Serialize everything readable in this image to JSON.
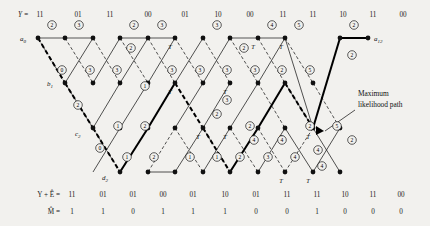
{
  "figure": {
    "background_color": "#f2f1ee",
    "ink_color": "#1a1a1a",
    "ml_path_color": "#000000"
  },
  "chart_data": {
    "type": "diagram",
    "subtype": "viterbi-trellis",
    "n_stages": 12,
    "n_states": 4,
    "state_labels": [
      "a",
      "b",
      "c",
      "d"
    ],
    "state_row_y": [
      38,
      83,
      128,
      172
    ],
    "column_x": [
      38,
      65,
      93,
      120,
      148,
      175,
      203,
      230,
      258,
      285,
      313,
      340,
      368
    ],
    "node_labels": [
      {
        "text": "a",
        "sub": "0",
        "x": 26,
        "y": 40
      },
      {
        "text": "b",
        "sub": "1",
        "x": 53,
        "y": 85
      },
      {
        "text": "c",
        "sub": "2",
        "x": 81,
        "y": 134
      },
      {
        "text": "d",
        "sub": "2",
        "x": 108,
        "y": 178
      },
      {
        "text": "a",
        "sub": "12",
        "x": 374,
        "y": 40
      }
    ],
    "received_label": "Y =",
    "received_sequence": [
      "11",
      "01",
      "11",
      "00",
      "01",
      "10",
      "00",
      "11",
      "11",
      "10",
      "11",
      "00"
    ],
    "corrected_label": "Y + Ê =",
    "corrected_sequence": [
      "11",
      "01",
      "01",
      "00",
      "01",
      "10",
      "01",
      "11",
      "11",
      "10",
      "11",
      "00"
    ],
    "message_label": "M̂ =",
    "message_bits": [
      "1",
      "1",
      "0",
      "1",
      "1",
      "1",
      "0",
      "0",
      "1",
      "0",
      "0",
      "0"
    ],
    "annotation": {
      "line1": "Maximum",
      "line2": "likelihood path"
    },
    "survivor_mark": "T",
    "path_metrics": [
      {
        "value": "2",
        "x": 52,
        "y": 25
      },
      {
        "value": "3",
        "x": 79,
        "y": 25
      },
      {
        "value": "2",
        "x": 134,
        "y": 25
      },
      {
        "value": "3",
        "x": 162,
        "y": 25
      },
      {
        "value": "3",
        "x": 217,
        "y": 25
      },
      {
        "value": "4",
        "x": 272,
        "y": 25
      },
      {
        "value": "5",
        "x": 299,
        "y": 25
      },
      {
        "value": "2",
        "x": 354,
        "y": 25
      },
      {
        "value": "2",
        "x": 131,
        "y": 48
      },
      {
        "value": "2",
        "x": 244,
        "y": 48
      },
      {
        "value": "2",
        "x": 352,
        "y": 55
      },
      {
        "value": "0",
        "x": 62,
        "y": 70
      },
      {
        "value": "3",
        "x": 90,
        "y": 70
      },
      {
        "value": "3",
        "x": 117,
        "y": 70
      },
      {
        "value": "3",
        "x": 172,
        "y": 70
      },
      {
        "value": "3",
        "x": 200,
        "y": 70
      },
      {
        "value": "3",
        "x": 227,
        "y": 70
      },
      {
        "value": "3",
        "x": 255,
        "y": 70
      },
      {
        "value": "2",
        "x": 282,
        "y": 70
      },
      {
        "value": "5",
        "x": 310,
        "y": 70
      },
      {
        "value": "1",
        "x": 145,
        "y": 86
      },
      {
        "value": "3",
        "x": 227,
        "y": 100
      },
      {
        "value": "2",
        "x": 78,
        "y": 105
      },
      {
        "value": "2",
        "x": 217,
        "y": 114
      },
      {
        "value": "1",
        "x": 118,
        "y": 126
      },
      {
        "value": "2",
        "x": 145,
        "y": 126
      },
      {
        "value": "2",
        "x": 250,
        "y": 126
      },
      {
        "value": "4",
        "x": 254,
        "y": 140
      },
      {
        "value": "4",
        "x": 282,
        "y": 140
      },
      {
        "value": "2",
        "x": 310,
        "y": 126
      },
      {
        "value": "5",
        "x": 337,
        "y": 126
      },
      {
        "value": "0",
        "x": 100,
        "y": 148
      },
      {
        "value": "1",
        "x": 127,
        "y": 157
      },
      {
        "value": "2",
        "x": 154,
        "y": 157
      },
      {
        "value": "1",
        "x": 190,
        "y": 157
      },
      {
        "value": "1",
        "x": 217,
        "y": 157
      },
      {
        "value": "2",
        "x": 240,
        "y": 157
      },
      {
        "value": "3",
        "x": 268,
        "y": 157
      },
      {
        "value": "4",
        "x": 295,
        "y": 157
      },
      {
        "value": "4",
        "x": 318,
        "y": 150
      },
      {
        "value": "4",
        "x": 322,
        "y": 166
      },
      {
        "value": "2",
        "x": 352,
        "y": 140
      }
    ]
  }
}
